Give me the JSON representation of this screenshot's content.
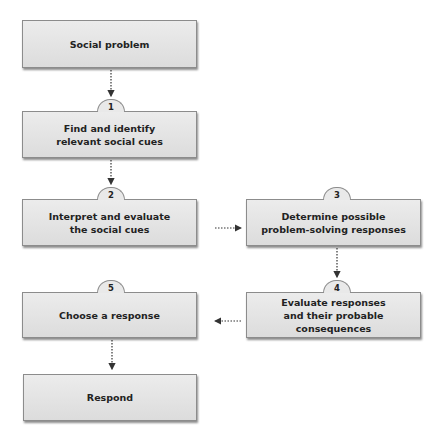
{
  "diagram": {
    "nodes": [
      {
        "id": "social-problem",
        "label": "Social problem",
        "step": null
      },
      {
        "id": "step-1",
        "label": "Find and identify\nrelevant social cues",
        "step": "1"
      },
      {
        "id": "step-2",
        "label": "Interpret and evaluate\nthe social cues",
        "step": "2"
      },
      {
        "id": "step-3",
        "label": "Determine possible\nproblem-solving responses",
        "step": "3"
      },
      {
        "id": "step-4",
        "label": "Evaluate responses\nand their probable consequences",
        "step": "4"
      },
      {
        "id": "step-5",
        "label": "Choose a response",
        "step": "5"
      },
      {
        "id": "respond",
        "label": "Respond",
        "step": null
      }
    ],
    "edges": [
      {
        "from": "social-problem",
        "to": "step-1"
      },
      {
        "from": "step-1",
        "to": "step-2"
      },
      {
        "from": "step-2",
        "to": "step-3"
      },
      {
        "from": "step-3",
        "to": "step-4"
      },
      {
        "from": "step-4",
        "to": "step-5"
      },
      {
        "from": "step-5",
        "to": "respond"
      }
    ],
    "colors": {
      "box_fill": "#e4e4e4",
      "box_border": "#8c8c8c",
      "text": "#222222",
      "arrow": "#333333"
    }
  }
}
